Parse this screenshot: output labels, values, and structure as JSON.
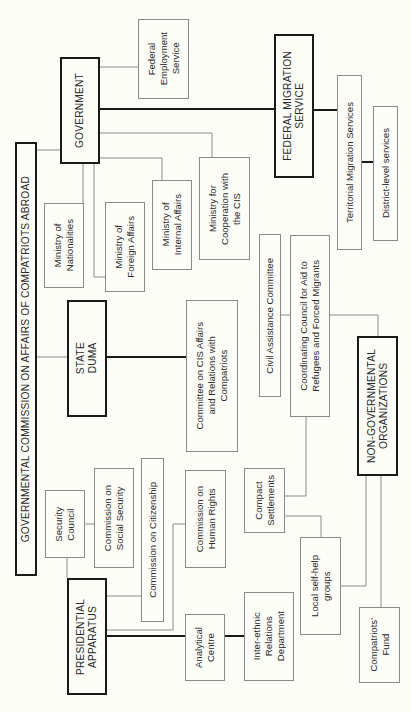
{
  "diagram": {
    "title": "GOVERNMENTAL COMMISSION ON AFFAIRS OF COMPATRIOTS ABROAD",
    "orientation": "rotated-90-ccw",
    "nodes": {
      "government": "GOVERNMENT",
      "federal_employment": "Federal\nEmployment\nService",
      "federal_migration": "FEDERAL MIGRATION\nSERVICE",
      "territorial_migration": "Territorial Migration Services",
      "district_services": "District-level services",
      "min_nationalities": "Ministry of\nNationalities",
      "min_foreign": "Ministry of\nForeign Affairs",
      "min_internal": "Ministry of\nInternal Affairs",
      "min_cis": "Ministry for\nCooperation with\nthe CIS",
      "state_duma": "STATE\nDUMA",
      "committee_cis": "Committee on CIS Affairs\nand Relations with\nCompatriots",
      "civil_assistance": "Civil Assistance Committee",
      "coordinating_council": "Coordinating Council for Aid to\nRefugees and Forced Migrants",
      "ngo": "NON-GOVERNMENTAL\nORGANIZATIONS",
      "security_council": "Security\nCouncil",
      "comm_social_security": "Commission on\nSocial Security",
      "comm_citizenship": "Commission on Citizenship",
      "comm_human_rights": "Commission on\nHuman Rights",
      "presidential": "PRESIDENTIAL\nAPPARATUS",
      "analytical_centre": "Analytical\nCentre",
      "interethnic": "Inter-ethnic\nRelations\nDepartment",
      "compact_settlements": "Compact\nSettlements",
      "local_groups": "Local self-help\ngroups",
      "compatriots_fund": "Compatriots'\nFund"
    },
    "colors": {
      "major_border": "#1a1a1a",
      "minor_border": "#8a8a8a",
      "background": "#fdfdf8"
    }
  }
}
